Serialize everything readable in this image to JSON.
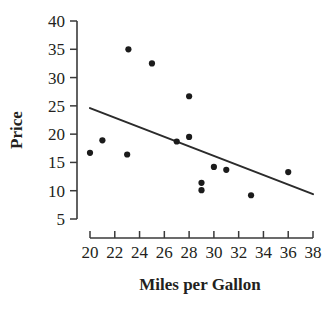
{
  "chart_data": {
    "type": "scatter",
    "title": "",
    "xlabel": "Miles per Gallon",
    "ylabel": "Price",
    "xlim": [
      20,
      38
    ],
    "ylim": [
      5,
      40
    ],
    "xticks": [
      20,
      22,
      24,
      26,
      28,
      30,
      32,
      34,
      36,
      38
    ],
    "yticks": [
      5,
      10,
      15,
      20,
      25,
      30,
      35,
      40
    ],
    "xtick_labels": [
      "20",
      "22",
      "24",
      "26",
      "28",
      "30",
      "32",
      "34",
      "36",
      "38"
    ],
    "ytick_labels": [
      "5",
      "10",
      "15",
      "20",
      "25",
      "30",
      "35",
      "40"
    ],
    "grid": false,
    "legend": false,
    "marker": "filled-circle",
    "marker_color": "#1b1b1b",
    "points": [
      {
        "x": 20.0,
        "y": 16.7
      },
      {
        "x": 21.0,
        "y": 18.9
      },
      {
        "x": 23.0,
        "y": 16.4
      },
      {
        "x": 23.1,
        "y": 35.0
      },
      {
        "x": 25.0,
        "y": 32.5
      },
      {
        "x": 27.0,
        "y": 18.7
      },
      {
        "x": 28.0,
        "y": 26.7
      },
      {
        "x": 28.0,
        "y": 19.5
      },
      {
        "x": 29.0,
        "y": 11.4
      },
      {
        "x": 29.0,
        "y": 10.1
      },
      {
        "x": 30.0,
        "y": 14.2
      },
      {
        "x": 31.0,
        "y": 13.7
      },
      {
        "x": 33.0,
        "y": 9.2
      },
      {
        "x": 36.0,
        "y": 13.3
      }
    ],
    "trend_line": {
      "type": "linear-fit",
      "color": "#2b2b2b",
      "x_start": 20.0,
      "y_start": 24.6,
      "x_end": 38.0,
      "y_end": 9.4
    }
  }
}
